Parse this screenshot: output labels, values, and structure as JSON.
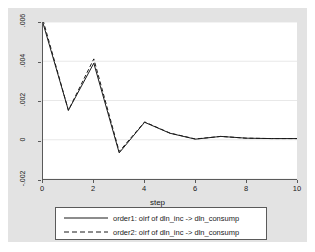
{
  "chart_data": {
    "type": "line",
    "title": "",
    "subtitle": "",
    "xlabel": "step",
    "ylabel": "",
    "xlim": [
      0,
      10
    ],
    "ylim": [
      -0.002,
      0.006
    ],
    "grid": true,
    "legend_position": "bottom",
    "x": [
      0,
      1,
      2,
      3,
      4,
      5,
      6,
      7,
      8,
      9,
      10
    ],
    "xticks": [
      "0",
      "2",
      "4",
      "6",
      "8",
      "10"
    ],
    "xtick_values": [
      0,
      2,
      4,
      6,
      8,
      10
    ],
    "yticks": [
      ".006",
      ".004",
      ".002",
      "0",
      "-.002"
    ],
    "ytick_values": [
      0.006,
      0.004,
      0.002,
      0,
      -0.002
    ],
    "series": [
      {
        "name": "order1: oirf of dln_inc -> dln_consump",
        "style": "solid",
        "color": "#1a1a1a",
        "values": [
          0.00594,
          0.0015,
          0.0039,
          -0.00067,
          0.00089,
          0.00033,
          3e-05,
          0.00017,
          8e-05,
          6e-05,
          6e-05
        ]
      },
      {
        "name": "order2: oirf of dln_inc -> dln_consump",
        "style": "dashed",
        "color": "#1a1a1a",
        "values": [
          0.0061,
          0.0015,
          0.00412,
          -0.0006,
          0.00091,
          0.00034,
          4e-05,
          0.00017,
          8e-05,
          6e-05,
          6e-05
        ]
      }
    ]
  },
  "legend": {
    "entries": [
      {
        "label": "order1: oirf of dln_inc -> dln_consump",
        "style": "solid"
      },
      {
        "label": "order2: oirf of dln_inc -> dln_consump",
        "style": "dashed"
      }
    ]
  },
  "axes": {
    "x_title": "step"
  },
  "colors": {
    "panel_background": "#e3e3e3",
    "plot_background": "#ffffff",
    "axis": "#5a5a5a",
    "gridline": "#e8e8e8",
    "line": "#1a1a1a",
    "text": "#1a1a1a"
  }
}
